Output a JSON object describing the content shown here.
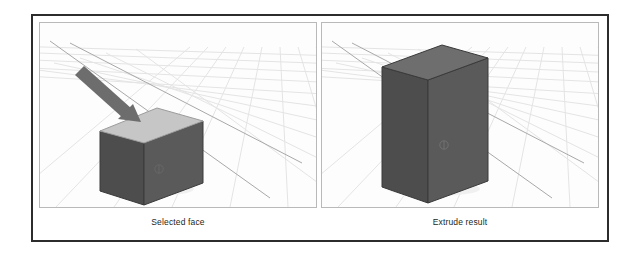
{
  "figure": {
    "type": "illustration",
    "frame_color": "#2c2c2c",
    "background_color": "#ffffff"
  },
  "panels": [
    {
      "id": "selected-face",
      "caption": "Selected face",
      "viewport": {
        "background_color": "#fdfdfd",
        "border_color": "#b9b9b9",
        "grid_color": "#e3e3e3",
        "axis_color": "#9a9a9a"
      },
      "object": {
        "name": "cube",
        "shape": "cube",
        "body_color": "#585858",
        "side_color": "#4f4f4f",
        "top_face_color": "#c6c6c6",
        "top_face_state": "selected",
        "edge_color": "#3c3c3c",
        "widget_glyph": "face-marker"
      },
      "annotation": {
        "name": "arrow",
        "points_to": "top face",
        "color": "#6b6b6b",
        "direction": "down-right"
      }
    },
    {
      "id": "extrude-result",
      "caption": "Extrude result",
      "viewport": {
        "background_color": "#fdfdfd",
        "border_color": "#b9b9b9",
        "grid_color": "#e3e3e3",
        "axis_color": "#9a9a9a"
      },
      "object": {
        "name": "extruded-box",
        "shape": "rectangular-prism",
        "body_color": "#585858",
        "side_color": "#4f4f4f",
        "top_face_color": "#6e6e6e",
        "top_face_state": "extruded",
        "edge_color": "#3c3c3c",
        "widget_glyph": "face-marker"
      },
      "annotation": null
    }
  ]
}
